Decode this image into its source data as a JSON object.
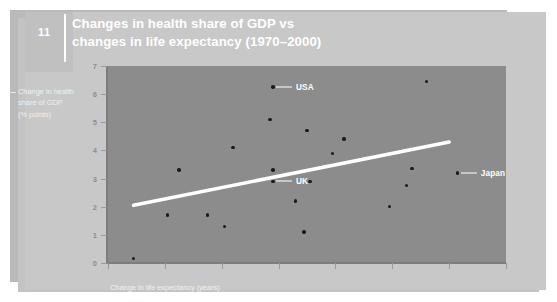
{
  "slide": {
    "number": "11",
    "title_line1": "Changes in health share of GDP vs",
    "title_line2": "changes in life expectancy (1970–2000)"
  },
  "axes": {
    "ylabel_line1": "Change in health",
    "ylabel_line2": "share of GDP",
    "ylabel_line3": "(% points)",
    "xlabel": "Change in life expectancy (years)"
  },
  "colors": {
    "slide_background": "#c8c8c8",
    "plot_background": "#8c8c8c",
    "trend_line": "#ffffff",
    "dot": "#1a1a1a",
    "title_text": "#ffffff"
  },
  "chart_data": {
    "type": "scatter",
    "title": "Changes in health share of GDP vs changes in life expectancy (1970–2000)",
    "xlabel": "Change in life expectancy (years)",
    "ylabel": "Change in health share of GDP (% points)",
    "xlim": [
      3,
      10
    ],
    "ylim": [
      0,
      7
    ],
    "xticks": [
      3,
      4,
      5,
      6,
      7,
      8,
      9,
      10
    ],
    "xtick_labels": [
      "3",
      "4",
      "5",
      "6",
      "7",
      "8",
      "9",
      "10"
    ],
    "yticks": [
      0,
      1,
      2,
      3,
      4,
      5,
      6,
      7
    ],
    "ytick_labels": [
      "0",
      "1",
      "2",
      "3",
      "4",
      "5",
      "6",
      "7"
    ],
    "grid": false,
    "legend": false,
    "points": [
      {
        "x": 3.45,
        "y": 0.15,
        "label": ""
      },
      {
        "x": 4.05,
        "y": 1.7,
        "label": ""
      },
      {
        "x": 4.25,
        "y": 3.3,
        "label": ""
      },
      {
        "x": 4.75,
        "y": 1.7,
        "label": ""
      },
      {
        "x": 5.05,
        "y": 1.3,
        "label": ""
      },
      {
        "x": 5.2,
        "y": 4.1,
        "label": ""
      },
      {
        "x": 5.85,
        "y": 5.1,
        "label": ""
      },
      {
        "x": 5.9,
        "y": 3.3,
        "label": ""
      },
      {
        "x": 5.9,
        "y": 2.9,
        "label": "UK"
      },
      {
        "x": 5.9,
        "y": 6.25,
        "label": "USA"
      },
      {
        "x": 6.3,
        "y": 2.2,
        "label": ""
      },
      {
        "x": 6.45,
        "y": 1.1,
        "label": ""
      },
      {
        "x": 6.5,
        "y": 4.7,
        "label": ""
      },
      {
        "x": 6.55,
        "y": 2.9,
        "label": ""
      },
      {
        "x": 6.95,
        "y": 3.9,
        "label": ""
      },
      {
        "x": 7.15,
        "y": 4.4,
        "label": ""
      },
      {
        "x": 7.95,
        "y": 2.0,
        "label": ""
      },
      {
        "x": 8.25,
        "y": 2.75,
        "label": ""
      },
      {
        "x": 8.35,
        "y": 3.35,
        "label": ""
      },
      {
        "x": 8.6,
        "y": 6.45,
        "label": ""
      },
      {
        "x": 9.15,
        "y": 3.2,
        "label": "Japan"
      }
    ],
    "trend_line": {
      "x0": 3.45,
      "y0": 2.05,
      "x1": 9.0,
      "y1": 4.3
    },
    "annotations": [
      {
        "text": "USA",
        "x": 5.9,
        "y": 6.25,
        "side": "right"
      },
      {
        "text": "UK",
        "x": 5.9,
        "y": 2.9,
        "side": "right"
      },
      {
        "text": "Japan",
        "x": 9.15,
        "y": 3.2,
        "side": "right"
      }
    ]
  }
}
